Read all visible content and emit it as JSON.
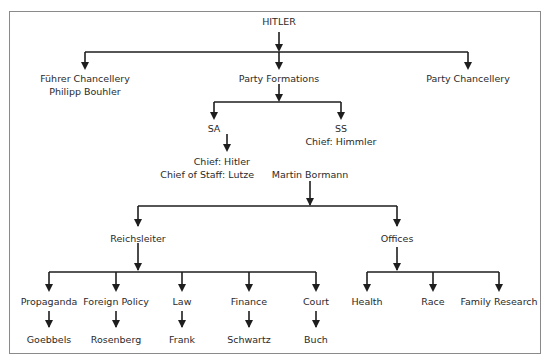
{
  "diagram": {
    "root": "HITLER",
    "level1": {
      "fuhrer_chancellery": [
        "Führer Chancellery",
        "Philipp Bouhler"
      ],
      "party_formations": "Party Formations",
      "party_chancellery": "Party Chancellery"
    },
    "formations": {
      "sa": "SA",
      "sa_chief": [
        "Chief: Hitler",
        "Chief of Staff: Lutze"
      ],
      "ss": [
        "SS",
        "Chief: Himmler"
      ]
    },
    "bormann": "Martin Bormann",
    "reichsleiter": {
      "label": "Reichsleiter",
      "departments": [
        {
          "name": "Propaganda",
          "head": "Goebbels"
        },
        {
          "name": "Foreign Policy",
          "head": "Rosenberg"
        },
        {
          "name": "Law",
          "head": "Frank"
        },
        {
          "name": "Finance",
          "head": "Schwartz"
        },
        {
          "name": "Court",
          "head": "Buch"
        }
      ]
    },
    "offices": {
      "label": "Offices",
      "items": [
        "Health",
        "Race",
        "Family Research"
      ]
    }
  }
}
